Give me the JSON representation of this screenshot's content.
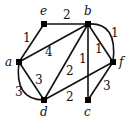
{
  "diagram": {
    "type": "weighted-graph",
    "nodes": [
      {
        "id": "a",
        "label": "a",
        "x": 19,
        "y": 62
      },
      {
        "id": "b",
        "label": "b",
        "x": 88,
        "y": 24
      },
      {
        "id": "c",
        "label": "c",
        "x": 88,
        "y": 100
      },
      {
        "id": "d",
        "label": "d",
        "x": 44,
        "y": 100
      },
      {
        "id": "e",
        "label": "e",
        "x": 44,
        "y": 24
      },
      {
        "id": "f",
        "label": "f",
        "x": 113,
        "y": 62
      }
    ],
    "edges": [
      {
        "from": "e",
        "to": "b",
        "weight": "2",
        "style": "straight"
      },
      {
        "from": "a",
        "to": "e",
        "weight": "1",
        "style": "straight"
      },
      {
        "from": "a",
        "to": "b",
        "weight": "4",
        "style": "straight"
      },
      {
        "from": "b",
        "to": "d",
        "weight": "2",
        "style": "straight"
      },
      {
        "from": "b",
        "to": "c",
        "weight": "1",
        "style": "straight"
      },
      {
        "from": "b",
        "to": "f",
        "weight": "1",
        "style": "straight"
      },
      {
        "from": "b",
        "to": "f",
        "weight": "1",
        "style": "curved"
      },
      {
        "from": "a",
        "to": "d",
        "weight": "3",
        "style": "straight"
      },
      {
        "from": "a",
        "to": "d",
        "weight": "3",
        "style": "curved"
      },
      {
        "from": "d",
        "to": "f",
        "weight": "2",
        "style": "straight"
      },
      {
        "from": "c",
        "to": "f",
        "weight": "3",
        "style": "straight"
      }
    ]
  }
}
